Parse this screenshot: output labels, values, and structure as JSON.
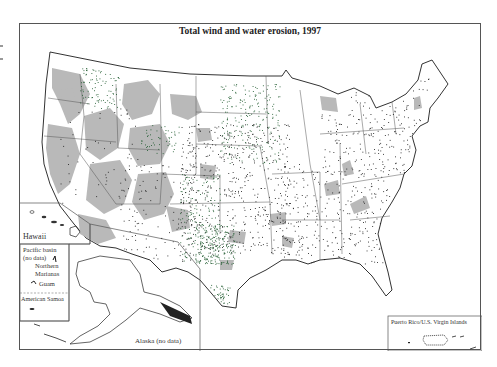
{
  "map": {
    "title": "Total wind and water erosion, 1997",
    "region": "Contiguous United States",
    "insets": {
      "hawaii": {
        "label": "Hawaii"
      },
      "pacific_basin": {
        "label_line1": "Pacific basin",
        "label_line2": "(no data)",
        "northern_marianas_line1": "Northern",
        "northern_marianas_line2": "Marianas",
        "guam": "Guam",
        "american_samoa": "American Samoa"
      },
      "alaska": {
        "label": "Alaska (no data)"
      },
      "puerto_rico": {
        "label": "Puerto Rico/U.S. Virgin Islands"
      }
    },
    "colors": {
      "background": "#ffffff",
      "frame": "#555555",
      "land_outline": "#333333",
      "gray_area": "#b9b9b9",
      "dot_black": "#1a1a1a",
      "dot_green": "#1f5a2e"
    },
    "legend_note": "Dots represent erosion sample points; gray shading represents non-cropland areas"
  }
}
